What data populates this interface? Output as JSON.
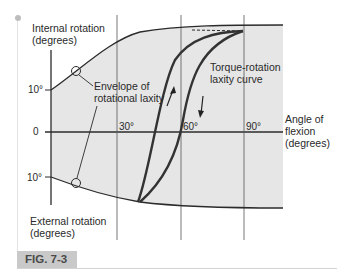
{
  "figure": {
    "label": "FIG. 7-3",
    "y_axis": {
      "top_label_line1": "Internal rotation",
      "top_label_line2": "(degrees)",
      "bottom_label_line1": "External rotation",
      "bottom_label_line2": "(degrees)",
      "ticks": [
        {
          "label": "10°",
          "position": "internal"
        },
        {
          "label": "0",
          "position": "zero"
        },
        {
          "label": "10°",
          "position": "external"
        }
      ]
    },
    "x_axis": {
      "label_line1": "Angle of",
      "label_line2": "flexion",
      "label_line3": "(degrees)",
      "ticks": [
        "30°",
        "60°",
        "90°"
      ]
    },
    "annotations": {
      "envelope_line1": "Envelope of",
      "envelope_line2": "rotational laxity",
      "curve_line1": "Torque-rotation",
      "curve_line2": "laxity curve"
    },
    "colors": {
      "shade": "#e6e6e6",
      "line": "#2b2b2b",
      "curve": "#333333",
      "badge": "#c9c9c9"
    }
  }
}
